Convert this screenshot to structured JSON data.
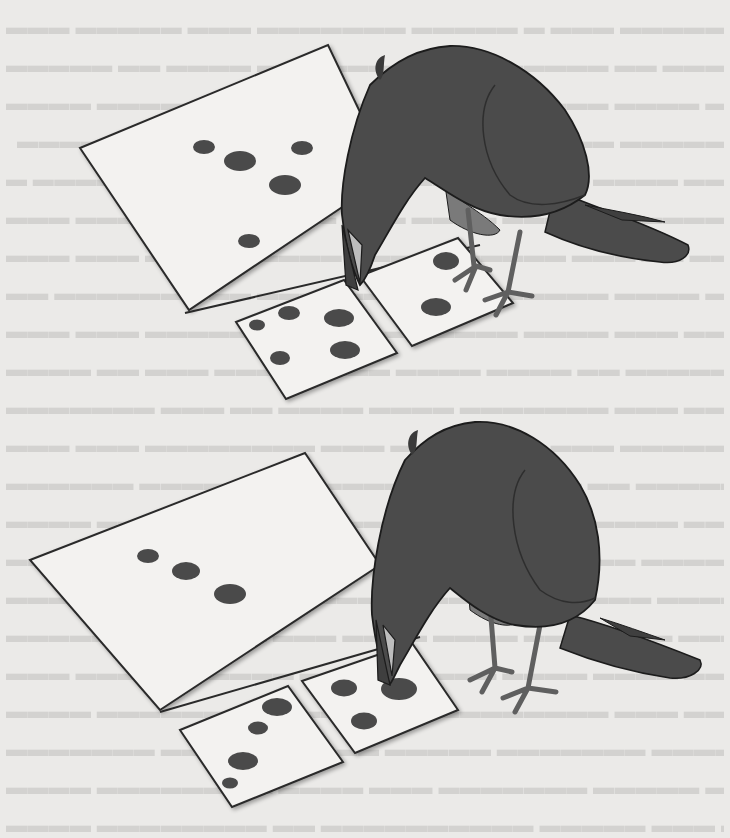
{
  "figure": {
    "background_text": "illegible bleed-through text from reverse page",
    "colors": {
      "paper": "#ebeae8",
      "card_fill": "#f3f2f0",
      "card_stroke": "#2a2a2a",
      "dot": "#4a4a4a",
      "crow_body": "#4b4b4b",
      "crow_belly": "#7a7a7a",
      "crow_outline": "#1c1c1c"
    },
    "scenes": [
      {
        "name": "top-scene",
        "sample_card": {
          "dot_count": 5
        },
        "choice_cards": [
          {
            "position": "left",
            "dot_count": 5
          },
          {
            "position": "right",
            "dot_count": 2
          }
        ]
      },
      {
        "name": "bottom-scene",
        "sample_card": {
          "dot_count": 3
        },
        "choice_cards": [
          {
            "position": "left",
            "dot_count": 4
          },
          {
            "position": "right",
            "dot_count": 3
          }
        ]
      }
    ]
  }
}
